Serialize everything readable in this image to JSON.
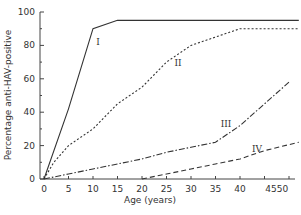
{
  "chart_data": {
    "type": "line",
    "title": "",
    "xlabel": "Age (years)",
    "ylabel": "Percentage anti-HAV-positive",
    "xlim": [
      0,
      52
    ],
    "ylim": [
      0,
      100
    ],
    "x_ticks": [
      "0",
      "5",
      "10",
      "15",
      "20",
      "25",
      "30",
      "35",
      "40",
      "4550"
    ],
    "y_ticks": [
      "0",
      "20",
      "40",
      "60",
      "80",
      "100"
    ],
    "grid": false,
    "legend": "inline labels",
    "series": [
      {
        "name": "I",
        "style": "solid",
        "x": [
          0,
          5,
          10,
          15,
          20,
          52
        ],
        "y": [
          0,
          42,
          90,
          95,
          95,
          95
        ]
      },
      {
        "name": "II",
        "style": "dotted",
        "x": [
          0,
          2,
          5,
          10,
          15,
          20,
          25,
          30,
          35,
          40,
          52
        ],
        "y": [
          0,
          10,
          20,
          30,
          45,
          55,
          70,
          80,
          85,
          90,
          90
        ]
      },
      {
        "name": "III",
        "style": "dash-dot",
        "x": [
          0,
          5,
          10,
          15,
          20,
          25,
          30,
          35,
          40,
          45,
          50
        ],
        "y": [
          0,
          3,
          6,
          9,
          12,
          16,
          19,
          22,
          32,
          45,
          58
        ]
      },
      {
        "name": "IV",
        "style": "dashed",
        "x": [
          20,
          25,
          30,
          35,
          40,
          45,
          52
        ],
        "y": [
          0,
          3,
          6,
          9,
          12,
          17,
          22
        ]
      }
    ]
  }
}
